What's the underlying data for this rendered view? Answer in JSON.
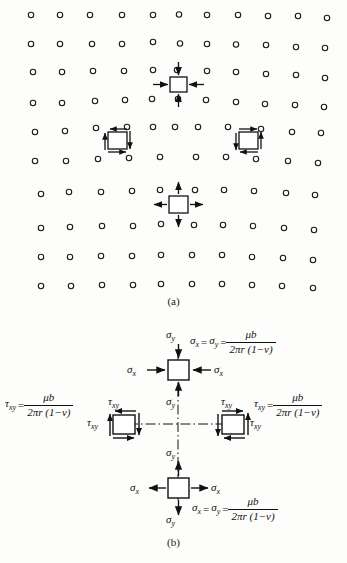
{
  "figure": {
    "captions": {
      "a": "(a)",
      "b": "(b)"
    },
    "colors": {
      "ink": "#111111",
      "background": "#fdfdfc",
      "atom_stroke": "#1a1a1a"
    }
  },
  "panel_a": {
    "name": "edge-dislocation-lattice",
    "description": "Crystal lattice of atoms with an extra half-plane producing an edge dislocation; four stress elements mark compression, tension and shear regions.",
    "lattice": {
      "rows_above_slip_plane": 5,
      "columns_above_slip_plane": 11,
      "rows_below_slip_plane": 5,
      "columns_below_slip_plane": 10,
      "atom_symbol": "open-circle"
    },
    "elements": [
      {
        "id": "compression-element",
        "type": "biaxial-compression",
        "arrows": "inward",
        "position": "above-slip-plane"
      },
      {
        "id": "shear-element-left",
        "type": "pure-shear",
        "arrows": "counterclockwise-couple",
        "position": "left-of-core"
      },
      {
        "id": "shear-element-right",
        "type": "pure-shear",
        "arrows": "clockwise-couple",
        "position": "right-of-core"
      },
      {
        "id": "tension-element",
        "type": "biaxial-tension",
        "arrows": "outward",
        "position": "below-slip-plane"
      }
    ]
  },
  "panel_b": {
    "name": "stress-state-diagram",
    "elements": {
      "top": {
        "id": "compression-element-b",
        "sense": "compression",
        "labels": {
          "sigma_y_top": "σ",
          "sigma_y_top_sub": "y",
          "sigma_y_bottom": "σ",
          "sigma_y_bottom_sub": "y",
          "sigma_x_left": "σ",
          "sigma_x_left_sub": "x",
          "sigma_x_right": "σ",
          "sigma_x_right_sub": "x"
        }
      },
      "bottom": {
        "id": "tension-element-b",
        "sense": "tension",
        "labels": {
          "sigma_y_top": "σ",
          "sigma_y_top_sub": "y",
          "sigma_y_bottom": "σ",
          "sigma_y_bottom_sub": "y",
          "sigma_x_left": "σ",
          "sigma_x_left_sub": "x",
          "sigma_x_right": "σ",
          "sigma_x_right_sub": "x"
        }
      },
      "left_shear": {
        "id": "shear-element-left-b",
        "labels": {
          "tau_top": "τ",
          "tau_top_sub": "xy",
          "tau_side": "τ",
          "tau_side_sub": "xy"
        }
      },
      "right_shear": {
        "id": "shear-element-right-b",
        "labels": {
          "tau_top": "τ",
          "tau_top_sub": "xy",
          "tau_side": "τ",
          "tau_side_sub": "xy"
        }
      }
    },
    "equations": {
      "sigma_top": {
        "lhs_first": "σ",
        "lhs_first_sub": "x",
        "equals_mid": "=",
        "lhs_second": "σ",
        "lhs_second_sub": "y",
        "equals_end": "=",
        "numerator": "μb",
        "denominator": "2πr (1−v)"
      },
      "sigma_bottom": {
        "lhs_first": "σ",
        "lhs_first_sub": "x",
        "equals_mid": "=",
        "lhs_second": "σ",
        "lhs_second_sub": "y",
        "equals_end": "=",
        "numerator": "μb",
        "denominator": "2πr (1−v)"
      },
      "tau_left": {
        "lhs": "τ",
        "lhs_sub": "xy",
        "equals": "=",
        "numerator": "μb",
        "denominator": "2πr (1−v)"
      },
      "tau_right": {
        "lhs": "τ",
        "lhs_sub": "xy",
        "equals": "=",
        "numerator": "μb",
        "denominator": "2πr (1−v)"
      }
    },
    "axes": {
      "horizontal": "dash-dot centerline",
      "vertical": "dash-dot centerline"
    }
  }
}
